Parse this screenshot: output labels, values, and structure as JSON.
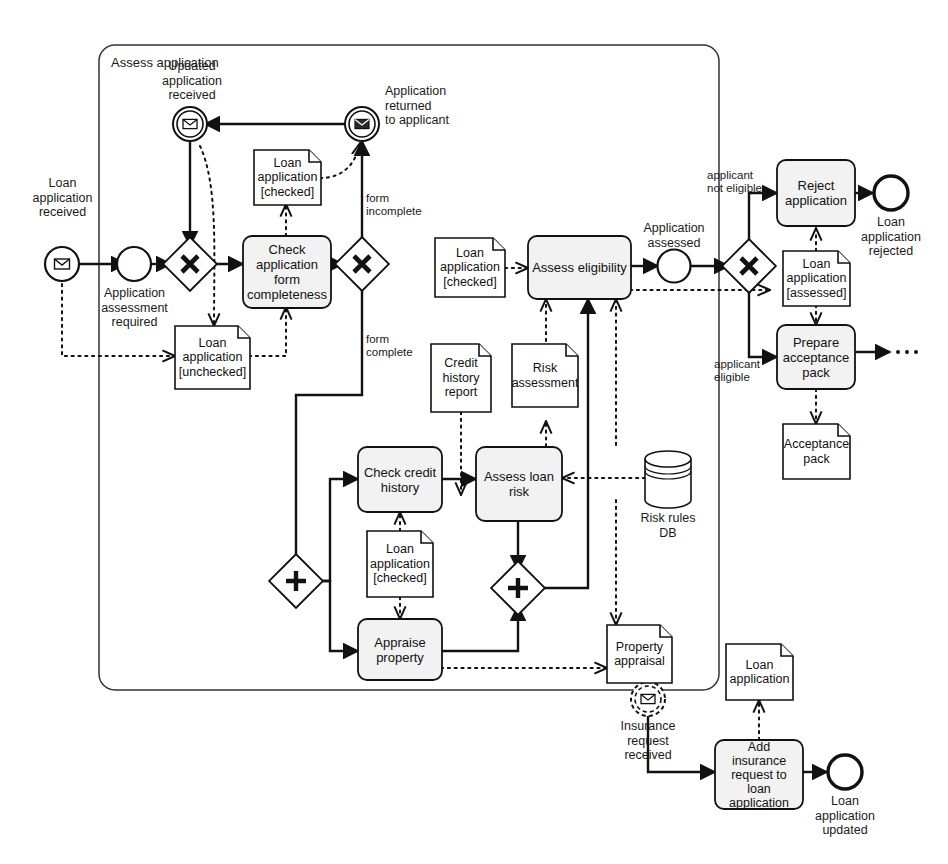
{
  "diagram": {
    "type": "bpmn-process-diagram",
    "title_visible": false,
    "pool": {
      "label": "Assess application"
    }
  },
  "events": [
    {
      "id": "ev-loan-received",
      "name": "message-start-event",
      "label": "Loan\napplication\nreceived"
    },
    {
      "id": "ev-updated-received",
      "name": "intermediate-message-catch-event",
      "label": "Updated\napplication\nreceived"
    },
    {
      "id": "ev-returned-applicant",
      "name": "intermediate-message-throw-event",
      "label": "Application\nreturned\nto applicant"
    },
    {
      "id": "ev-assessment-required",
      "name": "intermediate-event",
      "label": "Application\nassessment\nrequired"
    },
    {
      "id": "ev-app-assessed",
      "name": "intermediate-event",
      "label": "Application\nassessed"
    },
    {
      "id": "ev-loan-rejected",
      "name": "end-event",
      "label": "Loan\napplication\nrejected"
    },
    {
      "id": "ev-insurance-request",
      "name": "boundary-message-event",
      "label": "Insurance\nrequest\nreceived"
    },
    {
      "id": "ev-loan-updated",
      "name": "end-event",
      "label": "Loan\napplication\nupdated"
    }
  ],
  "tasks": [
    {
      "id": "t-check-form",
      "label": "Check\napplication\nform\ncompleteness"
    },
    {
      "id": "t-assess-elig",
      "label": "Assess eligibility"
    },
    {
      "id": "t-reject",
      "label": "Reject\napplication"
    },
    {
      "id": "t-prepare-pack",
      "label": "Prepare\nacceptance\npack"
    },
    {
      "id": "t-check-credit",
      "label": "Check credit\nhistory"
    },
    {
      "id": "t-assess-risk",
      "label": "Assess loan\nrisk"
    },
    {
      "id": "t-appraise",
      "label": "Appraise\nproperty"
    },
    {
      "id": "t-add-insurance",
      "label": "Add\ninsurance\nrequest to\nloan\napplication"
    }
  ],
  "gateways": [
    {
      "id": "gw-merge-x",
      "name": "exclusive-gateway",
      "symbol": "X"
    },
    {
      "id": "gw-form-x",
      "name": "exclusive-gateway",
      "symbol": "X"
    },
    {
      "id": "gw-elig-x",
      "name": "exclusive-gateway",
      "symbol": "X"
    },
    {
      "id": "gw-split-par",
      "name": "parallel-gateway",
      "symbol": "+"
    },
    {
      "id": "gw-join-par",
      "name": "parallel-gateway",
      "symbol": "+"
    }
  ],
  "data_objects": [
    {
      "id": "do-unchecked",
      "label": "Loan\napplication\n[unchecked]"
    },
    {
      "id": "do-checked-1",
      "label": "Loan\napplication\n[checked]"
    },
    {
      "id": "do-checked-2",
      "label": "Loan\napplication\n[checked]"
    },
    {
      "id": "do-checked-3",
      "label": "Loan\napplication\n[checked]"
    },
    {
      "id": "do-assessed",
      "label": "Loan\napplication\n[assessed]"
    },
    {
      "id": "do-credit",
      "label": "Credit\nhistory\nreport"
    },
    {
      "id": "do-risk",
      "label": "Risk\nassessment"
    },
    {
      "id": "do-acceptance",
      "label": "Acceptance\npack"
    },
    {
      "id": "do-appraisal",
      "label": "Property\nappraisal"
    },
    {
      "id": "do-loan-app",
      "label": "Loan\napplication"
    }
  ],
  "data_stores": [
    {
      "id": "ds-risk-rules",
      "label": "Risk rules\nDB"
    }
  ],
  "flow_labels": [
    {
      "id": "fl-form-incomplete",
      "label": "form\nincomplete"
    },
    {
      "id": "fl-form-complete",
      "label": "form\ncomplete"
    },
    {
      "id": "fl-not-eligible",
      "label": "applicant\nnot eligible"
    },
    {
      "id": "fl-eligible",
      "label": "applicant\neligible"
    }
  ],
  "colors": {
    "stroke": "#111111",
    "task_fill": "#f2f2f2",
    "doc_fill": "#ffffff",
    "pool_stroke": "#333333",
    "background": "#ffffff"
  }
}
